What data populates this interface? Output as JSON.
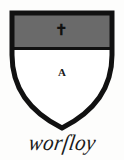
{
  "plate": {
    "background_color": "#fdfdfc",
    "ink_color": "#111111"
  },
  "shield": {
    "name": "heraldic-shield",
    "outline_color": "#111111",
    "outline_width": 5,
    "field": {
      "tincture_name": "argent",
      "color": "#ffffff",
      "charge_letter": "A"
    },
    "chief": {
      "tincture_name": "sable-grey",
      "color": "#6a6a6a",
      "charge_symbol": "✝",
      "charge_name": "small-cross-charge"
    }
  },
  "inscription": {
    "name": "worsley",
    "text": "worſloy",
    "reading": "worsley"
  }
}
